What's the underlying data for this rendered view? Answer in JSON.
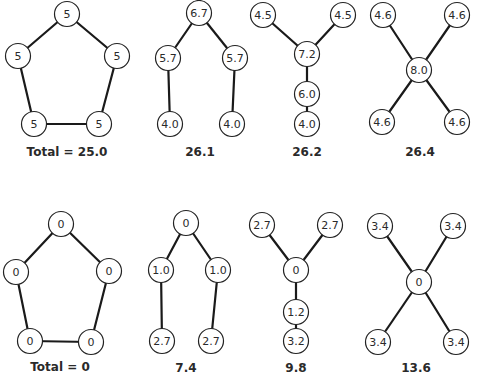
{
  "style": {
    "node_radius": 12.5,
    "stroke_color": "#222222",
    "edge_color": "#1a1a1a",
    "text_color": "#2a2a2a",
    "background": "#ffffff"
  },
  "graphs": [
    {
      "id": "top-pentagon",
      "caption": "Total = 25.0",
      "caption_pos": [
        67,
        152
      ],
      "nodes": [
        {
          "label": "5",
          "x": 67,
          "y": 14
        },
        {
          "label": "5",
          "x": 18,
          "y": 56
        },
        {
          "label": "5",
          "x": 117,
          "y": 56
        },
        {
          "label": "5",
          "x": 34,
          "y": 124
        },
        {
          "label": "5",
          "x": 99,
          "y": 124
        }
      ],
      "edges": [
        [
          0,
          1
        ],
        [
          0,
          2
        ],
        [
          1,
          3
        ],
        [
          2,
          4
        ],
        [
          3,
          4
        ]
      ]
    },
    {
      "id": "top-two-branch",
      "caption": "26.1",
      "caption_pos": [
        200,
        152
      ],
      "nodes": [
        {
          "label": "6.7",
          "x": 199,
          "y": 13
        },
        {
          "label": "5.7",
          "x": 168,
          "y": 58
        },
        {
          "label": "5.7",
          "x": 235,
          "y": 58
        },
        {
          "label": "4.0",
          "x": 170,
          "y": 124
        },
        {
          "label": "4.0",
          "x": 232,
          "y": 124
        }
      ],
      "edges": [
        [
          0,
          1
        ],
        [
          0,
          2
        ],
        [
          1,
          3
        ],
        [
          2,
          4
        ]
      ]
    },
    {
      "id": "top-y-chain",
      "caption": "26.2",
      "caption_pos": [
        307,
        152
      ],
      "nodes": [
        {
          "label": "4.5",
          "x": 263,
          "y": 15
        },
        {
          "label": "4.5",
          "x": 343,
          "y": 15
        },
        {
          "label": "7.2",
          "x": 307,
          "y": 54
        },
        {
          "label": "6.0",
          "x": 307,
          "y": 94
        },
        {
          "label": "4.0",
          "x": 307,
          "y": 124
        }
      ],
      "edges": [
        [
          0,
          2
        ],
        [
          1,
          2
        ],
        [
          2,
          3
        ],
        [
          3,
          4
        ]
      ]
    },
    {
      "id": "top-star",
      "caption": "26.4",
      "caption_pos": [
        420,
        152
      ],
      "nodes": [
        {
          "label": "4.6",
          "x": 383,
          "y": 15
        },
        {
          "label": "4.6",
          "x": 457,
          "y": 15
        },
        {
          "label": "8.0",
          "x": 419,
          "y": 70
        },
        {
          "label": "4.6",
          "x": 382,
          "y": 122
        },
        {
          "label": "4.6",
          "x": 457,
          "y": 122
        }
      ],
      "edges": [
        [
          0,
          2
        ],
        [
          1,
          2
        ],
        [
          2,
          3
        ],
        [
          2,
          4
        ]
      ]
    },
    {
      "id": "bottom-pentagon",
      "caption": "Total = 0",
      "caption_pos": [
        60,
        367
      ],
      "nodes": [
        {
          "label": "0",
          "x": 61,
          "y": 224
        },
        {
          "label": "0",
          "x": 16,
          "y": 272
        },
        {
          "label": "0",
          "x": 109,
          "y": 271
        },
        {
          "label": "0",
          "x": 30,
          "y": 341
        },
        {
          "label": "0",
          "x": 91,
          "y": 342
        }
      ],
      "edges": [
        [
          0,
          1
        ],
        [
          0,
          2
        ],
        [
          1,
          3
        ],
        [
          2,
          4
        ],
        [
          3,
          4
        ]
      ]
    },
    {
      "id": "bottom-two-branch",
      "caption": "7.4",
      "caption_pos": [
        186,
        368
      ],
      "nodes": [
        {
          "label": "0",
          "x": 186,
          "y": 223
        },
        {
          "label": "1.0",
          "x": 161,
          "y": 270
        },
        {
          "label": "1.0",
          "x": 218,
          "y": 270
        },
        {
          "label": "2.7",
          "x": 162,
          "y": 341
        },
        {
          "label": "2.7",
          "x": 211,
          "y": 341
        }
      ],
      "edges": [
        [
          0,
          1
        ],
        [
          0,
          2
        ],
        [
          1,
          3
        ],
        [
          2,
          4
        ]
      ]
    },
    {
      "id": "bottom-y-chain",
      "caption": "9.8",
      "caption_pos": [
        296,
        368
      ],
      "nodes": [
        {
          "label": "2.7",
          "x": 262,
          "y": 225
        },
        {
          "label": "2.7",
          "x": 330,
          "y": 225
        },
        {
          "label": "0",
          "x": 296,
          "y": 270
        },
        {
          "label": "1.2",
          "x": 296,
          "y": 312
        },
        {
          "label": "3.2",
          "x": 296,
          "y": 341
        }
      ],
      "edges": [
        [
          0,
          2
        ],
        [
          1,
          2
        ],
        [
          2,
          3
        ],
        [
          3,
          4
        ]
      ]
    },
    {
      "id": "bottom-star",
      "caption": "13.6",
      "caption_pos": [
        416,
        368
      ],
      "nodes": [
        {
          "label": "3.4",
          "x": 380,
          "y": 226
        },
        {
          "label": "3.4",
          "x": 453,
          "y": 226
        },
        {
          "label": "0",
          "x": 419,
          "y": 282
        },
        {
          "label": "3.4",
          "x": 378,
          "y": 342
        },
        {
          "label": "3.4",
          "x": 456,
          "y": 342
        }
      ],
      "edges": [
        [
          0,
          2
        ],
        [
          1,
          2
        ],
        [
          2,
          3
        ],
        [
          2,
          4
        ]
      ]
    }
  ]
}
